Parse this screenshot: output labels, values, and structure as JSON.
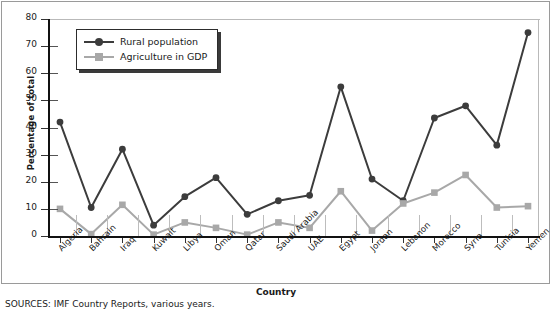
{
  "chart_data": {
    "type": "line",
    "title": "",
    "xlabel": "Country",
    "ylabel": "Percentage of total",
    "ylim": [
      0,
      80
    ],
    "yticks": [
      0,
      10,
      20,
      30,
      40,
      50,
      60,
      70,
      80
    ],
    "grid": false,
    "legend_position": "top-left",
    "categories": [
      "Algeria",
      "Bahrain",
      "Iraq",
      "Kuwait",
      "Libya",
      "Oman",
      "Qatar",
      "Saudi Arabia",
      "UAE",
      "Egypt",
      "Jordan",
      "Lebanon",
      "Morocco",
      "Syria",
      "Tunisia",
      "Yemen"
    ],
    "series": [
      {
        "name": "Rural population",
        "color": "#3c3c3c",
        "marker": "circle",
        "values": [
          42,
          10.5,
          32,
          4,
          14.5,
          21.5,
          8,
          13,
          15,
          55,
          21,
          13,
          43.5,
          48,
          33.5,
          75
        ]
      },
      {
        "name": "Agriculture in GDP",
        "color": "#a8a8a8",
        "marker": "square",
        "values": [
          10,
          0.7,
          11.5,
          0.5,
          5,
          3,
          0.5,
          5,
          3,
          16.5,
          2,
          12,
          16,
          22.5,
          10.5,
          11
        ]
      }
    ],
    "source_note": "SOURCES: IMF Country Reports, various years."
  }
}
